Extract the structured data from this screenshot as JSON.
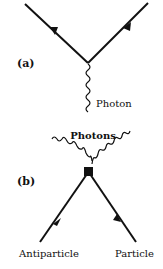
{
  "diagram": {
    "panel_a": {
      "label": "(a)",
      "photon_label": "Photon"
    },
    "panel_b": {
      "label": "(b)",
      "photons_label": "Photons",
      "antiparticle_label": "Antiparticle",
      "particle_label": "Particle"
    },
    "colors": {
      "line": "#111111",
      "background": "#ffffff"
    }
  }
}
